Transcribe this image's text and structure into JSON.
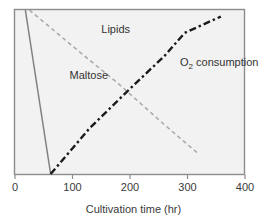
{
  "chart_data": {
    "type": "line",
    "title": "",
    "xlabel": "Cultivation time (hr)",
    "ylabel": "",
    "xlim": [
      0,
      400
    ],
    "ylim": [
      0,
      100
    ],
    "grid": false,
    "legend_position": "inline-annotations",
    "xticks": [
      0,
      100,
      200,
      300,
      400
    ],
    "xtick_labels": [
      "0",
      "100",
      "200",
      "300",
      "400"
    ],
    "yticks": [],
    "ytick_labels": [],
    "series": [
      {
        "name": "Maltose",
        "style": "solid",
        "color": "#808080",
        "label_x": 95,
        "label_y": 58,
        "x": [
          18,
          62
        ],
        "y": [
          100,
          0
        ]
      },
      {
        "name": "Lipids",
        "style": "dashed",
        "color": "#a8a8a8",
        "label_x": 150,
        "label_y": 86,
        "x": [
          25,
          100,
          180,
          260,
          320
        ],
        "y": [
          100,
          78,
          55,
          30,
          12
        ]
      },
      {
        "name": "O2 consumption",
        "label_main": "O",
        "label_sub": "2",
        "label_tail": " consumption",
        "style": "dashdot",
        "color": "#1a1a1a",
        "label_x": 287,
        "label_y": 66,
        "x": [
          62,
          130,
          200,
          260,
          295,
          320,
          358
        ],
        "y": [
          0,
          28,
          52,
          72,
          86,
          90,
          96
        ]
      }
    ]
  },
  "axis": {
    "frame_color": "#8c8c8c",
    "plot_background": "#f2f2f2"
  }
}
